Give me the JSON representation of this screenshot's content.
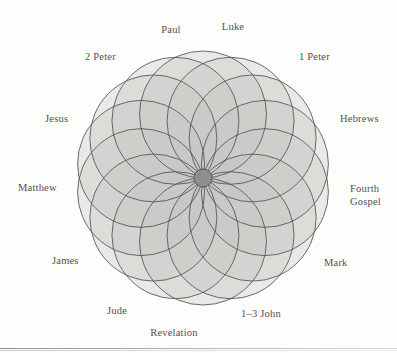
{
  "figure": {
    "type": "rosette-venn-diagram",
    "title": "",
    "center": {
      "x": 203,
      "y": 178
    },
    "outer_radius": 127,
    "petal_count": 14,
    "colors": {
      "stroke": "#4f4f4f",
      "fill_light": "#dcdcda",
      "fill_mid": "#c6c6c3",
      "center_dark": "#8f8f8d",
      "background": "#fdfdfc",
      "label_text": "#53504e"
    },
    "nodes": [
      {
        "id": "paul",
        "label": "Paul",
        "angle_deg": 77,
        "x": 171,
        "y": 24,
        "align": "center"
      },
      {
        "id": "luke",
        "label": "Luke",
        "angle_deg": 90,
        "x": 233,
        "y": 21,
        "align": "center"
      },
      {
        "id": "1-peter",
        "label": "1 Peter",
        "angle_deg": 51,
        "x": 299,
        "y": 51,
        "align": "left"
      },
      {
        "id": "hebrews",
        "label": "Hebrews",
        "angle_deg": 25,
        "x": 340,
        "y": 113,
        "align": "left"
      },
      {
        "id": "fourth-gospel",
        "label": "Fourth Gospel",
        "angle_deg": 0,
        "x": 350,
        "y": 183,
        "align": "left"
      },
      {
        "id": "mark",
        "label": "Mark",
        "angle_deg": -26,
        "x": 324,
        "y": 257,
        "align": "left"
      },
      {
        "id": "1-3-john",
        "label": "1–3 John",
        "angle_deg": -51,
        "x": 261,
        "y": 308,
        "align": "center"
      },
      {
        "id": "revelation",
        "label": "Revelation",
        "angle_deg": -77,
        "x": 174,
        "y": 327,
        "align": "center"
      },
      {
        "id": "jude",
        "label": "Jude",
        "angle_deg": -103,
        "x": 117,
        "y": 305,
        "align": "center"
      },
      {
        "id": "james",
        "label": "James",
        "angle_deg": -128,
        "x": 52,
        "y": 255,
        "align": "right"
      },
      {
        "id": "matthew",
        "label": "Matthew",
        "angle_deg": 180,
        "x": 18,
        "y": 182,
        "align": "right"
      },
      {
        "id": "jesus",
        "label": "Jesus",
        "angle_deg": 155,
        "x": 45,
        "y": 113,
        "align": "right"
      },
      {
        "id": "2-peter",
        "label": "2 Peter",
        "angle_deg": 129,
        "x": 85,
        "y": 51,
        "align": "right"
      }
    ]
  }
}
